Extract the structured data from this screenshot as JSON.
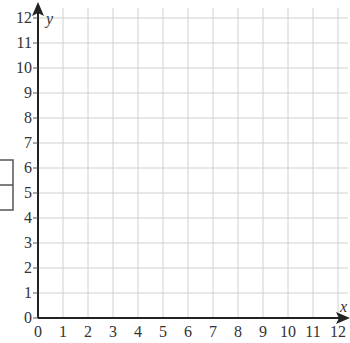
{
  "chart_data": {
    "type": "line",
    "title": "",
    "xlabel": "x",
    "ylabel": "y",
    "xlim": [
      0,
      12
    ],
    "ylim": [
      0,
      12
    ],
    "x_ticks": [
      "0",
      "1",
      "2",
      "3",
      "4",
      "5",
      "6",
      "7",
      "8",
      "9",
      "10",
      "11",
      "12"
    ],
    "y_ticks": [
      "0",
      "1",
      "2",
      "3",
      "4",
      "5",
      "6",
      "7",
      "8",
      "9",
      "10",
      "11",
      "12"
    ],
    "grid": true,
    "series": [],
    "legend": null,
    "annotations": [
      {
        "type": "box",
        "description": "empty two-cell box at left edge spanning y≈4.5 to 6.5, split at y≈5.5"
      }
    ]
  },
  "colors": {
    "grid": "#d0d0d0",
    "axis": "#222222",
    "text": "#333333",
    "box": "#555555"
  }
}
